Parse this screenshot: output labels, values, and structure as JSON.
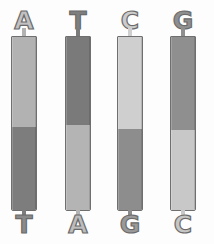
{
  "figure": {
    "type": "diagram",
    "background_color": "#fdfdfd",
    "outline_color": "#6b6b6b",
    "light_shade": "#b8b8b8",
    "dark_shade": "#7a7a7a",
    "pale_shade": "#d2d2d2"
  },
  "pairs": [
    {
      "id": "pair-a-t",
      "top_label": "A",
      "bottom_label": "T",
      "top_shade": "#b2b2b2",
      "bottom_shade": "#7d7d7d",
      "top_letter_color": "#c2c2c2",
      "bottom_letter_color": "#8a8a8a",
      "seam_percent": 52
    },
    {
      "id": "pair-t-a",
      "top_label": "T",
      "bottom_label": "A",
      "top_shade": "#7a7a7a",
      "bottom_shade": "#b4b4b4",
      "top_letter_color": "#7e7e7e",
      "bottom_letter_color": "#bdbdbd",
      "seam_percent": 51
    },
    {
      "id": "pair-c-g",
      "top_label": "C",
      "bottom_label": "G",
      "top_shade": "#cfcfcf",
      "bottom_shade": "#8d8d8d",
      "top_letter_color": "#cccccc",
      "bottom_letter_color": "#9a9a9a",
      "seam_percent": 53
    },
    {
      "id": "pair-g-c",
      "top_label": "G",
      "bottom_label": "C",
      "top_shade": "#8f8f8f",
      "bottom_shade": "#c8c8c8",
      "top_letter_color": "#8f8f8f",
      "bottom_letter_color": "#c6c6c6",
      "seam_percent": 54
    }
  ]
}
